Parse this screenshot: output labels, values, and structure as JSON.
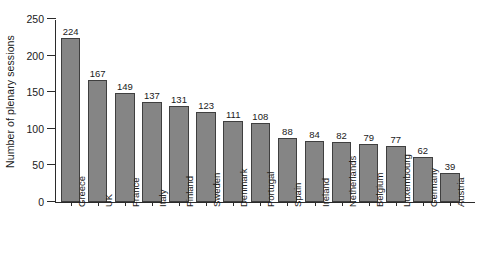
{
  "chart_data": {
    "type": "bar",
    "title": "",
    "subtitle": "",
    "xlabel": "",
    "ylabel": "Number of plenary sessions",
    "ylim": [
      0,
      250
    ],
    "yticks": [
      0,
      50,
      100,
      150,
      200,
      250
    ],
    "grid": false,
    "legend": null,
    "orientation": "vertical",
    "bar_color": "#858585",
    "bar_edge_color": "#3f3f3f",
    "value_labels_shown": true,
    "categories": [
      "Greece",
      "UK",
      "France",
      "Italy",
      "Finland",
      "Sweden",
      "Denmark",
      "Portugal",
      "Spain",
      "Ireland",
      "Netherlands",
      "Belgium",
      "Luxembourg",
      "Germany",
      "Austria"
    ],
    "values": [
      224,
      167,
      149,
      137,
      131,
      123,
      111,
      108,
      88,
      84,
      82,
      79,
      77,
      62,
      39
    ]
  },
  "axis": {
    "y_title": "Number of plenary sessions",
    "y_tick_labels": [
      "0",
      "50",
      "100",
      "150",
      "200",
      "250"
    ]
  }
}
